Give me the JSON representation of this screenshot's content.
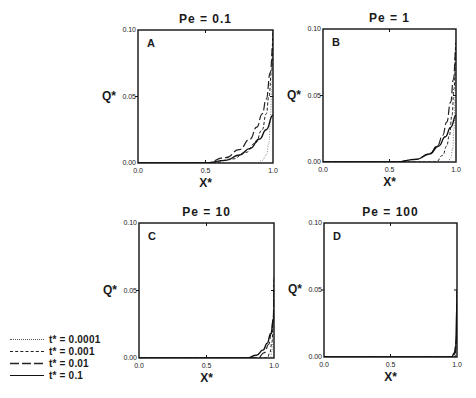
{
  "chart_data": {
    "type": "line",
    "layout": "2x2 panel grid",
    "shared": {
      "xlabel": "X*",
      "ylabel": "Q*",
      "xlim": [
        0.0,
        1.0
      ],
      "ylim": [
        0.0,
        0.1
      ],
      "xticks": [
        "0.0",
        "0.5",
        "1.0"
      ],
      "yticks": [
        "0.00",
        "0.05",
        "0.10"
      ],
      "grid": false,
      "legend_position": "lower-left outside panels"
    },
    "legend": [
      {
        "label": "t* = 0.0001",
        "style": "dotted"
      },
      {
        "label": "t* = 0.001",
        "style": "dashed"
      },
      {
        "label": "t* = 0.01",
        "style": "long-dash"
      },
      {
        "label": "t* = 0.1",
        "style": "solid"
      }
    ],
    "panels": [
      {
        "letter": "A",
        "title": "Pe = 0.1",
        "series": [
          {
            "name": "t* = 0.0001",
            "x": [
              0.0,
              0.88,
              0.92,
              0.95,
              0.97,
              0.98,
              0.99,
              1.0
            ],
            "y": [
              0.0,
              0.0,
              0.002,
              0.006,
              0.015,
              0.03,
              0.055,
              0.1
            ]
          },
          {
            "name": "t* = 0.001",
            "x": [
              0.0,
              0.55,
              0.7,
              0.8,
              0.87,
              0.92,
              0.95,
              0.97,
              0.99,
              1.0
            ],
            "y": [
              0.0,
              0.0,
              0.003,
              0.008,
              0.015,
              0.025,
              0.037,
              0.05,
              0.07,
              0.1
            ]
          },
          {
            "name": "t* = 0.01",
            "x": [
              0.0,
              0.5,
              0.65,
              0.75,
              0.83,
              0.88,
              0.92,
              0.95,
              0.98,
              1.0
            ],
            "y": [
              0.0,
              0.0,
              0.004,
              0.01,
              0.018,
              0.027,
              0.037,
              0.048,
              0.068,
              0.09
            ]
          },
          {
            "name": "t* = 0.1",
            "x": [
              0.0,
              0.5,
              0.65,
              0.75,
              0.83,
              0.9,
              0.95,
              1.0
            ],
            "y": [
              0.0,
              0.0,
              0.002,
              0.006,
              0.011,
              0.018,
              0.025,
              0.036
            ]
          }
        ]
      },
      {
        "letter": "B",
        "title": "Pe = 1",
        "series": [
          {
            "name": "t* = 0.0001",
            "x": [
              0.0,
              0.94,
              0.96,
              0.975,
              0.985,
              0.993,
              1.0
            ],
            "y": [
              0.0,
              0.0,
              0.003,
              0.01,
              0.025,
              0.05,
              0.1
            ]
          },
          {
            "name": "t* = 0.001",
            "x": [
              0.0,
              0.85,
              0.9,
              0.93,
              0.95,
              0.97,
              0.985,
              1.0
            ],
            "y": [
              0.0,
              0.0,
              0.005,
              0.012,
              0.02,
              0.035,
              0.055,
              0.09
            ]
          },
          {
            "name": "t* = 0.01",
            "x": [
              0.0,
              0.55,
              0.7,
              0.8,
              0.86,
              0.9,
              0.93,
              0.96,
              0.98,
              1.0
            ],
            "y": [
              0.0,
              0.0,
              0.002,
              0.006,
              0.012,
              0.02,
              0.03,
              0.045,
              0.062,
              0.085
            ]
          },
          {
            "name": "t* = 0.1",
            "x": [
              0.0,
              0.55,
              0.7,
              0.8,
              0.87,
              0.92,
              0.96,
              1.0
            ],
            "y": [
              0.0,
              0.0,
              0.002,
              0.006,
              0.012,
              0.019,
              0.026,
              0.035
            ]
          }
        ]
      },
      {
        "letter": "C",
        "title": "Pe = 10",
        "series": [
          {
            "name": "t* = 0.0001",
            "x": [
              0.0,
              0.975,
              0.985,
              0.993,
              1.0
            ],
            "y": [
              0.0,
              0.0,
              0.005,
              0.02,
              0.06
            ]
          },
          {
            "name": "t* = 0.001",
            "x": [
              0.0,
              0.95,
              0.97,
              0.985,
              0.995,
              1.0
            ],
            "y": [
              0.0,
              0.0,
              0.004,
              0.012,
              0.03,
              0.06
            ]
          },
          {
            "name": "t* = 0.01",
            "x": [
              0.0,
              0.88,
              0.93,
              0.96,
              0.98,
              0.995,
              1.0
            ],
            "y": [
              0.0,
              0.0,
              0.004,
              0.01,
              0.018,
              0.03,
              0.05
            ]
          },
          {
            "name": "t* = 0.1",
            "x": [
              0.0,
              0.8,
              0.87,
              0.92,
              0.95,
              0.975,
              1.0
            ],
            "y": [
              0.0,
              0.0,
              0.002,
              0.006,
              0.011,
              0.018,
              0.03
            ]
          }
        ]
      },
      {
        "letter": "D",
        "title": "Pe = 100",
        "series": [
          {
            "name": "t* = 0.0001",
            "x": [
              0.0,
              0.99,
              0.996,
              1.0
            ],
            "y": [
              0.0,
              0.0,
              0.01,
              0.05
            ]
          },
          {
            "name": "t* = 0.001",
            "x": [
              0.0,
              0.985,
              0.993,
              1.0
            ],
            "y": [
              0.0,
              0.0,
              0.008,
              0.05
            ]
          },
          {
            "name": "t* = 0.01",
            "x": [
              0.0,
              0.975,
              0.988,
              0.996,
              1.0
            ],
            "y": [
              0.0,
              0.0,
              0.004,
              0.015,
              0.05
            ]
          },
          {
            "name": "t* = 0.1",
            "x": [
              0.0,
              0.96,
              0.98,
              0.99,
              1.0
            ],
            "y": [
              0.0,
              0.0,
              0.003,
              0.008,
              0.04
            ]
          }
        ]
      }
    ]
  }
}
